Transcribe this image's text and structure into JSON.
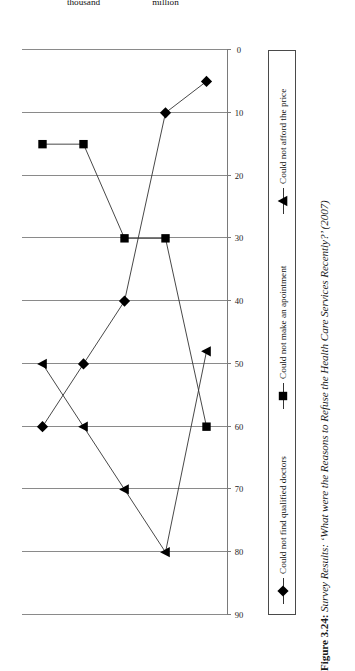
{
  "caption": {
    "figure_number": "Figure 3.24:",
    "text": "Survey Results: ‘What were the Reasons to Refuse the Health Care Services Recently?’ (2007)"
  },
  "chart_data": {
    "type": "line",
    "orientation": "rotated-90",
    "title": "Survey Results: ‘What were the Reasons to Refuse the Health Care Services Recently?’ (2007)",
    "xlabel": "",
    "ylabel": "",
    "ylim": [
      0,
      90
    ],
    "ytick_step": 10,
    "grid": true,
    "legend_position": "bottom",
    "yticks": [
      "90",
      "80",
      "70",
      "60",
      "50",
      "40",
      "30",
      "20",
      "10",
      "0"
    ],
    "categories": [
      "Cities with more than 1 million population",
      "Cities with population of 100 thousand to 100,000 million",
      "Cities with population of 20 to 20,000 thousand",
      "Urban villages with population of less than 20 thousand",
      "Small villages"
    ],
    "series": [
      {
        "name": "Could not find qualified doctors",
        "marker": "diamond",
        "values": [
          5,
          10,
          40,
          50,
          60
        ]
      },
      {
        "name": "Could not make an apointment",
        "marker": "square",
        "values": [
          60,
          30,
          30,
          15,
          15
        ]
      },
      {
        "name": "Could not afford the price",
        "marker": "triangle",
        "values": [
          48,
          80,
          70,
          60,
          50
        ]
      }
    ]
  },
  "legend": {
    "items": [
      {
        "label": "Could not find qualified doctors",
        "marker": "diamond-marker-icon"
      },
      {
        "label": "Could not make an apointment",
        "marker": "square-marker-icon"
      },
      {
        "label": "Could not afford the price",
        "marker": "triangle-marker-icon"
      }
    ]
  },
  "style": {
    "ink": "#111111",
    "grid": "#8a8a8a",
    "line": "#333333"
  }
}
